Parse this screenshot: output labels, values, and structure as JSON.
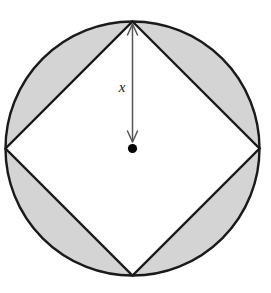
{
  "figure": {
    "canvas": {
      "width": 271,
      "height": 293,
      "background_color": "#ffffff"
    },
    "circle": {
      "name": "outer-circle",
      "center_x": 132.5,
      "center_y": 148.5,
      "radius": 127,
      "fill_color": "#d4d4d4",
      "stroke_color": "#1a1a1a",
      "stroke_width": 2.4
    },
    "square": {
      "name": "inscribed-square",
      "orientation": "rotated-45",
      "fill_color": "#ffffff",
      "stroke_color": "#1a1a1a",
      "stroke_width": 2.4,
      "vertices": [
        {
          "name": "top-vertex",
          "x": 132.5,
          "y": 21.5
        },
        {
          "name": "right-vertex",
          "x": 259.5,
          "y": 148.5
        },
        {
          "name": "bottom-vertex",
          "x": 132.5,
          "y": 275.5
        },
        {
          "name": "left-vertex",
          "x": 5.5,
          "y": 148.5
        }
      ],
      "points_attr": "132.5,21.5 259.5,148.5 132.5,275.5 5.5,148.5"
    },
    "shaded_regions": {
      "name": "circular-segments",
      "count": 4,
      "fill_color": "#d4d4d4",
      "note": "Region between the circle and the inscribed square is shaded."
    },
    "center_dot": {
      "name": "center-point",
      "x": 132.5,
      "y": 148.5,
      "radius": 4.6,
      "color": "#000000"
    },
    "dimension_arrow": {
      "name": "radius-dimension-arrow",
      "label": "x",
      "label_x": 122,
      "label_y": 92,
      "from_x": 132.5,
      "from_y": 24,
      "to_x": 132.5,
      "to_y": 142,
      "color": "#555555",
      "stroke_width": 1.5,
      "double_headed": true,
      "head_half_width": 5,
      "head_length": 11
    }
  }
}
